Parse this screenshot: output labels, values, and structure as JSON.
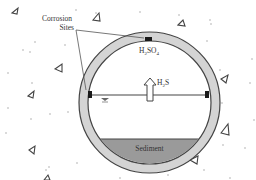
{
  "diagram": {
    "type": "sewer-pipe-cross-section",
    "labels": {
      "corrosion_sites_line1": "Corrosion",
      "corrosion_sites_line2": "Sites",
      "acid_main": "H",
      "acid_sub1": "2",
      "acid_mid": "SO",
      "acid_sub2": "4",
      "gas_main": "H",
      "gas_sub": "2",
      "gas_tail": "S",
      "sediment": "Sediment"
    },
    "colors": {
      "pipe_wall": "#d4d4d4",
      "pipe_outline": "#444444",
      "sediment": "#9a9a9a",
      "corrosion_marker": "#1a1a1a",
      "aggregate": "#555555",
      "background": "#ffffff"
    },
    "icons": {
      "water_level": "inverted-triangle-water-surface-icon",
      "gas_flow": "up-arrow-icon",
      "aggregate": "triangle-aggregate-icon"
    }
  }
}
